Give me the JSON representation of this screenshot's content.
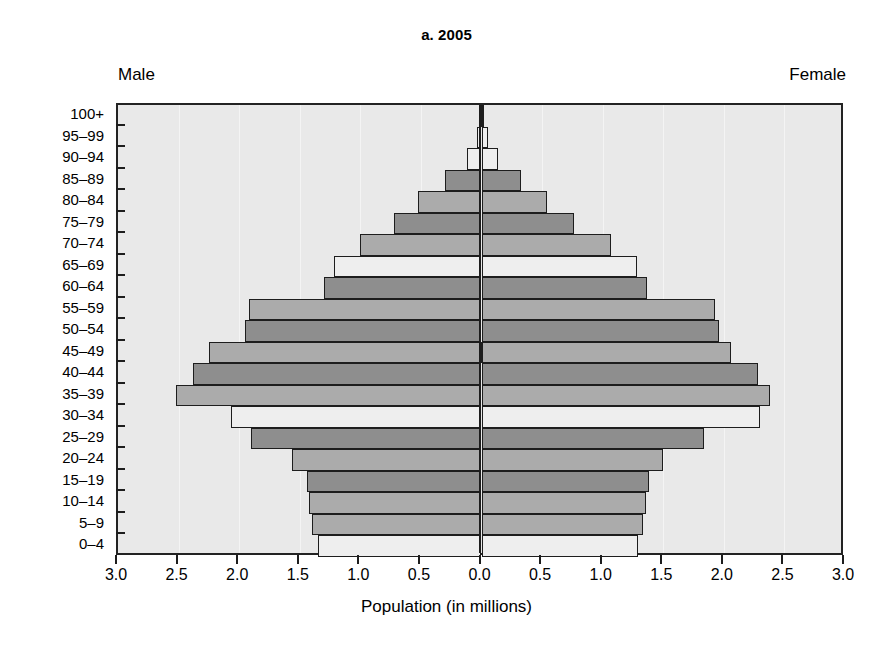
{
  "chart_data": {
    "type": "bar",
    "subtype": "population-pyramid",
    "title": "a. 2005",
    "xlabel": "Population (in millions)",
    "ylabel": "",
    "left_label": "Male",
    "right_label": "Female",
    "categories": [
      "100+",
      "95–99",
      "90–94",
      "85–89",
      "80–84",
      "75–79",
      "70–74",
      "65–69",
      "60–64",
      "55–59",
      "50–54",
      "45–49",
      "40–44",
      "35–39",
      "30–34",
      "25–29",
      "20–24",
      "15–19",
      "10–14",
      "5–9",
      "0–4"
    ],
    "series": [
      {
        "name": "Male",
        "side": "left",
        "values": [
          0.01,
          0.04,
          0.12,
          0.3,
          0.52,
          0.72,
          1.0,
          1.22,
          1.3,
          1.92,
          1.95,
          2.25,
          2.38,
          2.52,
          2.07,
          1.9,
          1.56,
          1.44,
          1.42,
          1.4,
          1.35
        ]
      },
      {
        "name": "Female",
        "side": "right",
        "values": [
          0.01,
          0.05,
          0.14,
          0.33,
          0.54,
          0.76,
          1.07,
          1.28,
          1.37,
          1.93,
          1.96,
          2.06,
          2.28,
          2.38,
          2.3,
          1.84,
          1.5,
          1.38,
          1.36,
          1.33,
          1.29
        ]
      }
    ],
    "row_shades": [
      "dark",
      "light",
      "light",
      "dark",
      "mid",
      "dark",
      "mid",
      "light",
      "dark",
      "mid",
      "dark",
      "mid",
      "dark",
      "mid",
      "light",
      "dark",
      "mid",
      "dark",
      "mid",
      "mid",
      "light"
    ],
    "xlim": [
      -3.0,
      3.0
    ],
    "xticks": [
      -3.0,
      -2.5,
      -2.0,
      -1.5,
      -1.0,
      -0.5,
      0.0,
      0.5,
      1.0,
      1.5,
      2.0,
      2.5,
      3.0
    ],
    "xtick_labels": [
      "3.0",
      "2.5",
      "2.0",
      "1.5",
      "1.0",
      "0.5",
      "0.0",
      "0.5",
      "1.0",
      "1.5",
      "2.0",
      "2.5",
      "3.0"
    ],
    "grid": true,
    "legend": "none",
    "colors": {
      "bar_dark": "#8e8e8e",
      "bar_mid": "#ababab",
      "bar_light": "#eeeeee",
      "bar_outline": "#1d1d1d",
      "plot_background": "#e9e9e9",
      "axis": "#232323",
      "text": "#000000"
    }
  }
}
